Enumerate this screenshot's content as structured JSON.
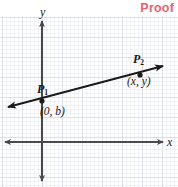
{
  "heading": {
    "text": "Proof",
    "color": "#e8636b"
  },
  "figure": {
    "kind": "coordinate-plane-diagram",
    "grid": {
      "visible": true,
      "minor_spacing_px": 4,
      "major_spacing_px": 20,
      "minor_color": "#b0bac8",
      "major_color": "#96a3b6"
    },
    "axes": {
      "color": "#4a4a4a",
      "x_label": "x",
      "y_label": "y",
      "origin_px": {
        "x": 42,
        "y": 142
      }
    },
    "line": {
      "color": "#1a1a1a",
      "double_arrow": true,
      "start_px": {
        "x": 4,
        "y": 108
      },
      "end_px": {
        "x": 167,
        "y": 65
      }
    },
    "points": [
      {
        "name": "P",
        "subscript": "1",
        "coordinate_label": "(0, b)",
        "px": {
          "x": 42,
          "y": 101
        }
      },
      {
        "name": "P",
        "subscript": "2",
        "coordinate_label": "(x, y)",
        "px": {
          "x": 140,
          "y": 72
        }
      }
    ]
  }
}
